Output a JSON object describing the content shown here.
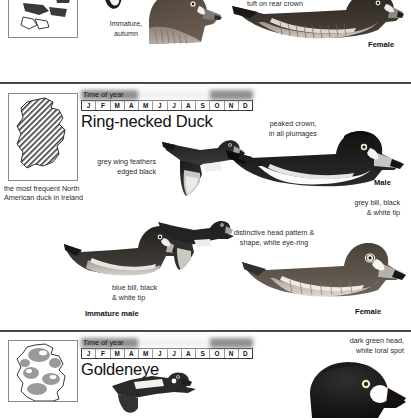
{
  "page": {
    "width": 411,
    "height": 397,
    "background": "#ffffff",
    "rule_color": "#4a4a4a"
  },
  "month_labels": [
    "J",
    "F",
    "M",
    "A",
    "M",
    "J",
    "J",
    "A",
    "S",
    "O",
    "N",
    "D"
  ],
  "time_of_year_title": "Time of year",
  "sections": [
    {
      "id": "tufted-duck-partial",
      "species": "",
      "map_caption": "",
      "annotations": [
        {
          "name": "crown-tuft-note",
          "text": "tuft on rear crown"
        }
      ],
      "labels": [
        {
          "name": "immature-autumn",
          "text": "Immature,\nautumn",
          "line1": "Immature,",
          "line2": "autumn"
        },
        {
          "name": "female",
          "text": "Female"
        }
      ]
    },
    {
      "id": "ring-necked-duck",
      "species": "Ring-necked Duck",
      "map_caption_line1": "the most frequent North",
      "map_caption_line2": "American duck in Ireland",
      "occurrence": [
        1,
        1,
        1,
        1,
        0,
        0,
        0,
        0,
        0,
        1,
        1,
        1
      ],
      "annotations": [
        {
          "name": "peaked-crown-note",
          "line1": "peaked crown,",
          "line2": "in all plumages"
        },
        {
          "name": "grey-wing-note",
          "line1": "grey wing feathers",
          "line2": "edged black"
        },
        {
          "name": "grey-bill-note",
          "line1": "grey bill, black",
          "line2": "& white tip"
        },
        {
          "name": "head-pattern-note",
          "line1": "distinctive head pattern &",
          "line2": "shape, white eye-ring"
        },
        {
          "name": "blue-bill-note",
          "line1": "blue bill, black",
          "line2": "& white tip"
        }
      ],
      "labels": [
        {
          "name": "male",
          "text": "Male"
        },
        {
          "name": "immature-male",
          "text": "Immature male"
        },
        {
          "name": "female",
          "text": "Female"
        }
      ]
    },
    {
      "id": "goldeneye",
      "species": "Goldeneye",
      "occurrence": [
        1,
        1,
        1,
        1,
        0,
        0,
        0,
        0,
        0,
        1,
        1,
        1
      ],
      "annotations": [
        {
          "name": "green-head-note",
          "line1": "dark green head,",
          "line2": "white loral spot"
        }
      ],
      "labels": []
    }
  ],
  "colors": {
    "ink": "#1a1a1a",
    "anno_text": "#2b2b2b",
    "map_border": "#8a8a8a",
    "month_border": "#3a3a3a",
    "shade_dark": "#8f8f8f",
    "shade_light": "#f2f2f2"
  }
}
